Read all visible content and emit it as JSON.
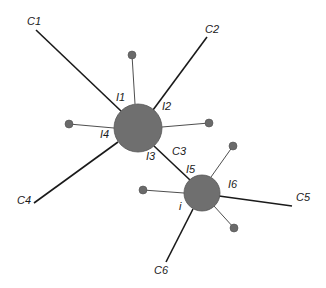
{
  "diagram": {
    "type": "network-graph",
    "colors": {
      "node_fill": "#6f6f6f",
      "edge": "#1a1a1a",
      "background": "#ffffff"
    },
    "nodes": {
      "hub_large": {
        "cx": 138,
        "cy": 128,
        "r": 24
      },
      "hub_small": {
        "cx": 202,
        "cy": 193,
        "r": 18,
        "label": "i"
      },
      "dots": [
        {
          "cx": 132,
          "cy": 55,
          "r": 4
        },
        {
          "cx": 69,
          "cy": 124,
          "r": 4
        },
        {
          "cx": 209,
          "cy": 123,
          "r": 4
        },
        {
          "cx": 143,
          "cy": 190,
          "r": 4
        },
        {
          "cx": 233,
          "cy": 146,
          "r": 4
        },
        {
          "cx": 234,
          "cy": 228,
          "r": 4
        }
      ]
    },
    "branch_labels": {
      "c1": "C1",
      "c2": "C2",
      "c3": "C3",
      "c4": "C4",
      "c5": "C5",
      "c6": "C6"
    },
    "intersection_labels": {
      "i1": "I1",
      "i2": "I2",
      "i3": "I3",
      "i4": "I4",
      "i5": "I5",
      "i6": "I6",
      "i": "i"
    }
  }
}
